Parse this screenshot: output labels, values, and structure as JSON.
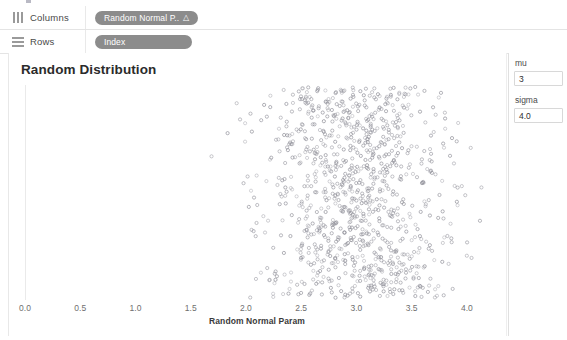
{
  "shelves": [
    {
      "icon": "columns-icon",
      "label": "Columns",
      "pill": {
        "text": "Random Normal P..",
        "marker": "△"
      }
    },
    {
      "icon": "rows-icon",
      "label": "Rows",
      "pill": {
        "text": "Index",
        "marker": ""
      }
    }
  ],
  "chart_data": {
    "type": "scatter",
    "title": "Random Distribution",
    "xlabel": "Random Normal Param",
    "ylabel": "",
    "xlim": [
      0.0,
      4.2
    ],
    "ylim": [
      0,
      1000
    ],
    "grid": false,
    "legend": null,
    "point_color": "#8f8f98",
    "point_size": 1.6,
    "n_points": 1000,
    "distribution": {
      "kind": "normal",
      "mu": 3,
      "sigma": 4.0,
      "y": "index"
    },
    "xticks": [
      {
        "value": 0.0,
        "label": "0.0"
      },
      {
        "value": 0.5,
        "label": "0.5"
      },
      {
        "value": 1.0,
        "label": "1.0"
      },
      {
        "value": 1.5,
        "label": "1.5"
      },
      {
        "value": 2.0,
        "label": "2.0"
      },
      {
        "value": 2.5,
        "label": "2.5"
      },
      {
        "value": 3.0,
        "label": "3.0"
      },
      {
        "value": 3.5,
        "label": "3.5"
      },
      {
        "value": 4.0,
        "label": "4.0"
      }
    ]
  },
  "controls": [
    {
      "name": "mu",
      "label": "mu",
      "value": "3"
    },
    {
      "name": "sigma",
      "label": "sigma",
      "value": "4.0"
    }
  ]
}
